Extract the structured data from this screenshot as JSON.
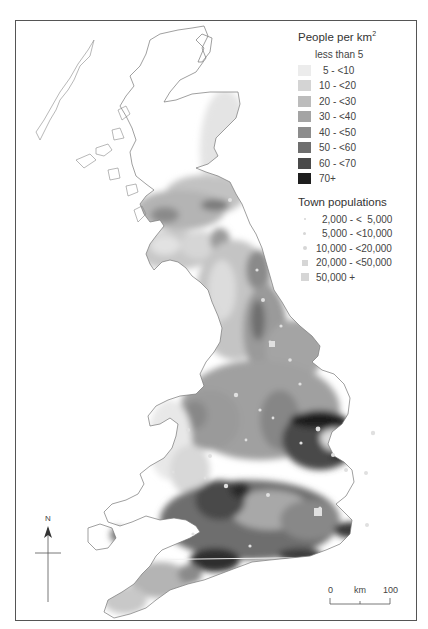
{
  "density_legend": {
    "title": "People per km",
    "title_sup": "2",
    "classes": [
      {
        "label": "less than 5",
        "color": "#ffffff"
      },
      {
        "label": "5 - <10",
        "color": "#ececec"
      },
      {
        "label": "10 - <20",
        "color": "#d4d4d4"
      },
      {
        "label": "20 - <30",
        "color": "#bcbcbc"
      },
      {
        "label": "30 - <40",
        "color": "#a4a4a4"
      },
      {
        "label": "40 - <50",
        "color": "#8c8c8c"
      },
      {
        "label": "50 - <60",
        "color": "#6e6e6e"
      },
      {
        "label": "60 - <70",
        "color": "#4a4a4a"
      },
      {
        "label": "70+",
        "color": "#1e1e1e"
      }
    ]
  },
  "town_legend": {
    "title": "Town populations",
    "classes": [
      {
        "label": "2,000 - <  5,000",
        "symbol": "dot-tiny"
      },
      {
        "label": "5,000 - <10,000",
        "symbol": "dot-small"
      },
      {
        "label": "10,000 - <20,000",
        "symbol": "dot-medium"
      },
      {
        "label": "20,000 - <50,000",
        "symbol": "square-small"
      },
      {
        "label": "50,000 +",
        "symbol": "square-large"
      }
    ]
  },
  "north_arrow": {
    "label": "N",
    "icon": "north-arrow-icon"
  },
  "scale_bar": {
    "start": "0",
    "unit": "km",
    "end": "100"
  },
  "colors": {
    "frame": "#555555",
    "coastline": "#777777",
    "town": "#dcdcdc"
  }
}
